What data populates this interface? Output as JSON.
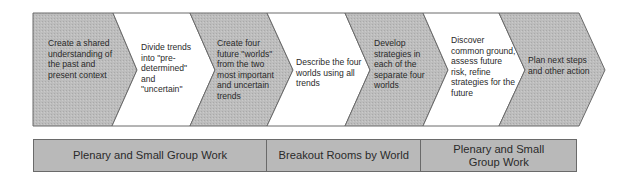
{
  "colors": {
    "gray_fill": "#b9b9b9",
    "white_fill": "#ffffff",
    "outline": "#6a6a6a",
    "text": "#2a2a2a"
  },
  "steps": [
    {
      "label": "Create a shared understanding of the past and present context",
      "fill": "gray"
    },
    {
      "label": "Divide trends into \"pre-determined\" and \"uncertain\"",
      "fill": "white"
    },
    {
      "label": "Create four future \"worlds\" from the two most important and uncertain trends",
      "fill": "gray"
    },
    {
      "label": "Describe the four worlds using all trends",
      "fill": "white"
    },
    {
      "label": "Develop strategies in each of the separate four worlds",
      "fill": "gray"
    },
    {
      "label": "Discover common ground, assess future risk, refine strategies for the future",
      "fill": "white"
    },
    {
      "label": "Plan next steps and other action",
      "fill": "gray"
    }
  ],
  "phases": [
    {
      "label": "Plenary and Small Group Work"
    },
    {
      "label": "Breakout Rooms by World"
    },
    {
      "label": "Plenary and Small Group Work"
    }
  ]
}
